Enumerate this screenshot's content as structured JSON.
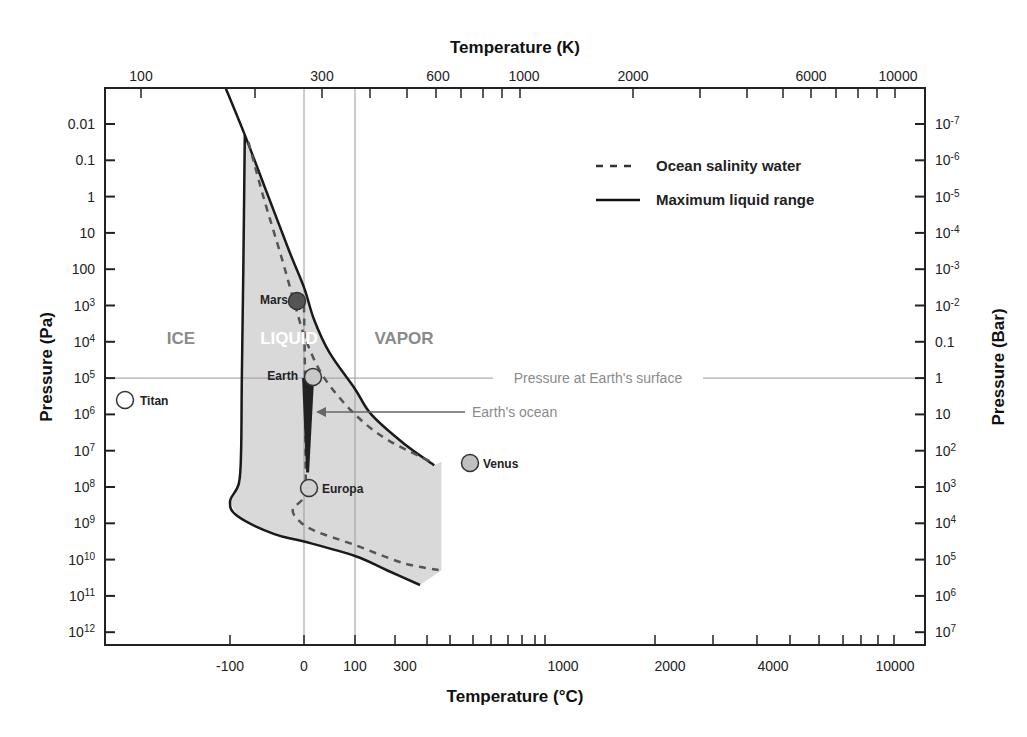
{
  "chart_data": {
    "type": "line",
    "xlabel_bottom": "Temperature (°C)",
    "xlabel_top": "Temperature (K)",
    "ylabel_left": "Pressure (Pa)",
    "ylabel_right": "Pressure (Bar)",
    "y_scale": "log",
    "ylim_pa": [
      0.001,
      3000000000000.0
    ],
    "y_inverted": true,
    "grid": false,
    "bottom_ticks": [
      {
        "value": -100,
        "label": "-100"
      },
      {
        "value": 0,
        "label": "0"
      },
      {
        "value": 100,
        "label": "100"
      },
      {
        "value": 300,
        "label": "300"
      },
      {
        "value": 1000,
        "label": "1000"
      },
      {
        "value": 2000,
        "label": "2000"
      },
      {
        "value": 4000,
        "label": "4000"
      },
      {
        "value": 10000,
        "label": "10000"
      }
    ],
    "top_ticks": [
      {
        "value": 100,
        "label": "100"
      },
      {
        "value": 300,
        "label": "300"
      },
      {
        "value": 600,
        "label": "600"
      },
      {
        "value": 1000,
        "label": "1000"
      },
      {
        "value": 2000,
        "label": "2000"
      },
      {
        "value": 6000,
        "label": "6000"
      },
      {
        "value": 10000,
        "label": "10000"
      }
    ],
    "left_ticks": [
      {
        "exp": -2,
        "label": "0.01",
        "sup": ""
      },
      {
        "exp": -1,
        "label": "0.1",
        "sup": ""
      },
      {
        "exp": 0,
        "label": "1",
        "sup": ""
      },
      {
        "exp": 1,
        "label": "10",
        "sup": ""
      },
      {
        "exp": 2,
        "label": "100",
        "sup": ""
      },
      {
        "exp": 3,
        "label": "10",
        "sup": "3"
      },
      {
        "exp": 4,
        "label": "10",
        "sup": "4"
      },
      {
        "exp": 5,
        "label": "10",
        "sup": "5"
      },
      {
        "exp": 6,
        "label": "10",
        "sup": "6"
      },
      {
        "exp": 7,
        "label": "10",
        "sup": "7"
      },
      {
        "exp": 8,
        "label": "10",
        "sup": "8"
      },
      {
        "exp": 9,
        "label": "10",
        "sup": "9"
      },
      {
        "exp": 10,
        "label": "10",
        "sup": "10"
      },
      {
        "exp": 11,
        "label": "10",
        "sup": "11"
      },
      {
        "exp": 12,
        "label": "10",
        "sup": "12"
      }
    ],
    "right_ticks": [
      {
        "exp": -2,
        "label": "10",
        "sup": "-7"
      },
      {
        "exp": -1,
        "label": "10",
        "sup": "-6"
      },
      {
        "exp": 0,
        "label": "10",
        "sup": "-5"
      },
      {
        "exp": 1,
        "label": "10",
        "sup": "-4"
      },
      {
        "exp": 2,
        "label": "10",
        "sup": "-3"
      },
      {
        "exp": 3,
        "label": "10",
        "sup": "-2"
      },
      {
        "exp": 4,
        "label": "0.1",
        "sup": ""
      },
      {
        "exp": 5,
        "label": "1",
        "sup": ""
      },
      {
        "exp": 6,
        "label": "10",
        "sup": ""
      },
      {
        "exp": 7,
        "label": "10",
        "sup": "2"
      },
      {
        "exp": 8,
        "label": "10",
        "sup": "3"
      },
      {
        "exp": 9,
        "label": "10",
        "sup": "4"
      },
      {
        "exp": 10,
        "label": "10",
        "sup": "5"
      },
      {
        "exp": 11,
        "label": "10",
        "sup": "6"
      },
      {
        "exp": 12,
        "label": "10",
        "sup": "7"
      }
    ],
    "reference_lines": {
      "vertical_celsius": [
        0,
        100
      ],
      "horizontal_pa_exp": 5,
      "horizontal_label": "Pressure at Earth's surface"
    },
    "regions": [
      {
        "name": "ICE",
        "t_c": -165,
        "p_exp": 4
      },
      {
        "name": "LIQUID",
        "t_c": -20,
        "p_exp": 4
      },
      {
        "name": "VAPOR",
        "t_c": 140,
        "p_exp": 4
      }
    ],
    "series": [
      {
        "name": "Maximum liquid range",
        "style": "solid",
        "points_tc_pexp": [
          [
            -105,
            -3
          ],
          [
            -80,
            -1.7
          ],
          [
            -50,
            -0.1
          ],
          [
            -20,
            1.5
          ],
          [
            0,
            2.5
          ],
          [
            20,
            3.4
          ],
          [
            50,
            4.3
          ],
          [
            100,
            5.3
          ],
          [
            150,
            6.0
          ],
          [
            250,
            6.8
          ],
          [
            380,
            7.4
          ]
        ]
      },
      {
        "name": "Maximum liquid range (melt)",
        "style": "solid",
        "points_tc_pexp": [
          [
            -80,
            -1.7
          ],
          [
            -82,
            2
          ],
          [
            -84,
            5
          ],
          [
            -85,
            7
          ],
          [
            -88,
            7.9
          ],
          [
            -100,
            8.4
          ],
          [
            -90,
            8.8
          ],
          [
            -40,
            9.3
          ],
          [
            0,
            9.5
          ],
          [
            100,
            9.9
          ],
          [
            200,
            10.3
          ],
          [
            300,
            10.7
          ]
        ]
      },
      {
        "name": "Ocean salinity water",
        "style": "dashed",
        "points_tc_pexp": [
          [
            -75,
            -1.5
          ],
          [
            -55,
            0
          ],
          [
            -30,
            1.7
          ],
          [
            -12,
            3
          ],
          [
            5,
            4
          ],
          [
            40,
            5
          ],
          [
            100,
            6
          ],
          [
            200,
            6.7
          ],
          [
            360,
            7.3
          ]
        ]
      },
      {
        "name": "Ocean salinity water (liquid-ice)",
        "style": "dashed",
        "points_tc_pexp": [
          [
            0,
            3
          ],
          [
            2,
            5
          ],
          [
            3,
            7
          ],
          [
            1,
            8.2
          ],
          [
            -15,
            8.6
          ],
          [
            -8,
            8.9
          ],
          [
            20,
            9.2
          ],
          [
            100,
            9.6
          ],
          [
            250,
            10.1
          ],
          [
            420,
            10.3
          ]
        ]
      }
    ],
    "shaded_region": {
      "name": "Liquid water range",
      "color": "#d9d9d9"
    },
    "earth_ocean": {
      "label": "Earth's ocean",
      "t_c": 8,
      "p_exp_range": [
        5,
        7.6
      ]
    },
    "planets": [
      {
        "name": "Mars",
        "t_c": -10,
        "p_exp": 2.9,
        "fill": "#555555"
      },
      {
        "name": "Earth",
        "t_c": 15,
        "p_exp": 5,
        "fill": "#c8c8c8"
      },
      {
        "name": "Titan",
        "t_c": -180,
        "p_exp": 5.6,
        "fill": "#ffffff"
      },
      {
        "name": "Venus",
        "t_c": 460,
        "p_exp": 7.3,
        "fill": "#c0c0c0"
      },
      {
        "name": "Europa",
        "t_c": 8,
        "p_exp": 8.1,
        "fill": "#d0d0d0"
      }
    ],
    "legend": {
      "position": "top-right",
      "entries": [
        {
          "label": "Ocean salinity water",
          "style": "dashed"
        },
        {
          "label": "Maximum liquid range",
          "style": "solid"
        }
      ]
    },
    "colors": {
      "line": "#1a1a1a",
      "dashed": "#555555",
      "shade": "#d9d9d9",
      "reference": "#9a9a9a",
      "annotation": "#8a8a8a"
    }
  }
}
